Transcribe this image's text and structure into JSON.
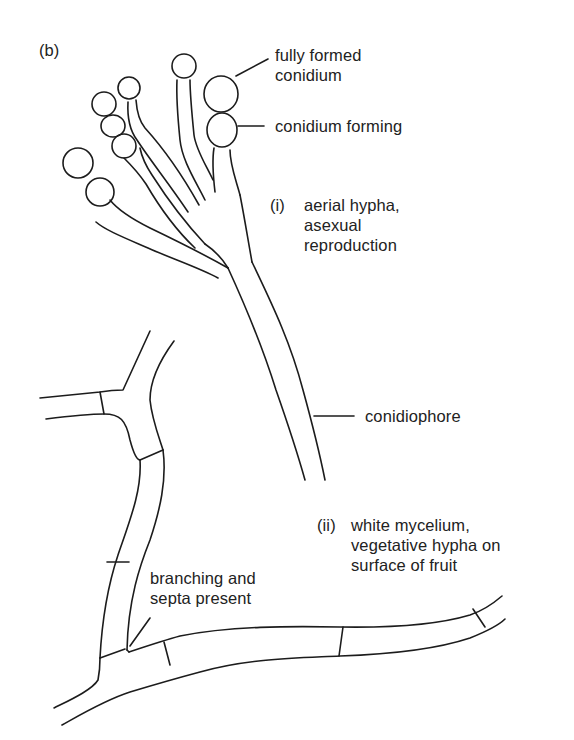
{
  "figure": {
    "panel_label": "(b)",
    "stroke_color": "#1c1c1c",
    "background": "#ffffff"
  },
  "labels": {
    "fully_formed_conidium": [
      "fully formed",
      "conidium"
    ],
    "conidium_forming": "conidium forming",
    "aerial_hypha": {
      "numeral": "(i)",
      "lines": [
        "aerial hypha,",
        "asexual",
        "reproduction"
      ]
    },
    "conidiophore": "conidiophore",
    "white_mycelium": {
      "numeral": "(ii)",
      "lines": [
        "white mycelium,",
        "vegetative hypha on",
        "surface of fruit"
      ]
    },
    "branching_septa": [
      "branching and",
      "septa present"
    ]
  }
}
